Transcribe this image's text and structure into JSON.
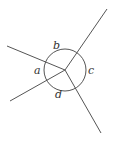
{
  "diagram": {
    "center": [
      65,
      70
    ],
    "radius": 21,
    "rays": [
      {
        "name": "ray-upper-right",
        "end": [
          107,
          9
        ]
      },
      {
        "name": "ray-upper-left",
        "end": [
          7,
          46
        ]
      },
      {
        "name": "ray-lower-left",
        "end": [
          10,
          101
        ]
      },
      {
        "name": "ray-lower-right",
        "end": [
          101,
          133
        ]
      }
    ],
    "labels": {
      "a": "a",
      "b": "b",
      "c": "c",
      "d": "d"
    },
    "stroke_color": "#555555"
  }
}
